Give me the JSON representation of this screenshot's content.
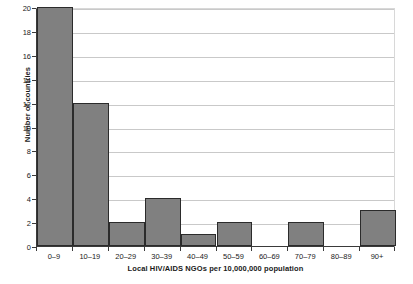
{
  "chart_data": {
    "type": "bar",
    "title": "",
    "subtitle": "",
    "xlabel": "Local HIV/AIDS NGOs per 10,000,000 population",
    "ylabel": "Number of countries",
    "categories": [
      "0–9",
      "10–19",
      "20–29",
      "30–39",
      "40–49",
      "50–59",
      "60–69",
      "70–79",
      "80–89",
      "90+"
    ],
    "values": [
      20,
      12,
      2,
      4,
      1,
      2,
      0,
      2,
      0,
      3
    ],
    "ylim": [
      0,
      20
    ],
    "ytick_values": [
      0,
      2,
      4,
      6,
      8,
      10,
      12,
      14,
      16,
      18,
      20
    ],
    "ytick_labels": [
      "0",
      "2",
      "4",
      "6",
      "8",
      "10",
      "12",
      "14",
      "16",
      "18",
      "20"
    ],
    "grid": "horizontal",
    "legend": "none",
    "bar_color": "#808080",
    "bar_edge_color": "#2b2b2b",
    "grid_color": "#c9c9c9",
    "axis_color": "#3a3a3a",
    "background_color": "#ffffff"
  }
}
